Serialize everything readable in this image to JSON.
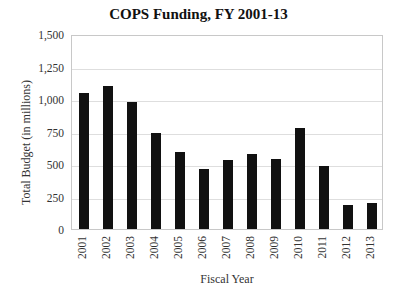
{
  "chart_data": {
    "type": "bar",
    "title": "COPS Funding, FY 2001-13",
    "xlabel": "Fiscal Year",
    "ylabel": "Total Budget (in millions)",
    "ylim": [
      0,
      1500
    ],
    "yticks": [
      "0",
      "250",
      "500",
      "750",
      "1,000",
      "1,250",
      "1,500"
    ],
    "grid": true,
    "legend": null,
    "categories": [
      "2001",
      "2002",
      "2003",
      "2004",
      "2005",
      "2006",
      "2007",
      "2008",
      "2009",
      "2010",
      "2011",
      "2012",
      "2013"
    ],
    "values": [
      1046,
      1100,
      977,
      738,
      592,
      462,
      531,
      577,
      538,
      777,
      485,
      185,
      200
    ],
    "bar_color": "#111111"
  }
}
